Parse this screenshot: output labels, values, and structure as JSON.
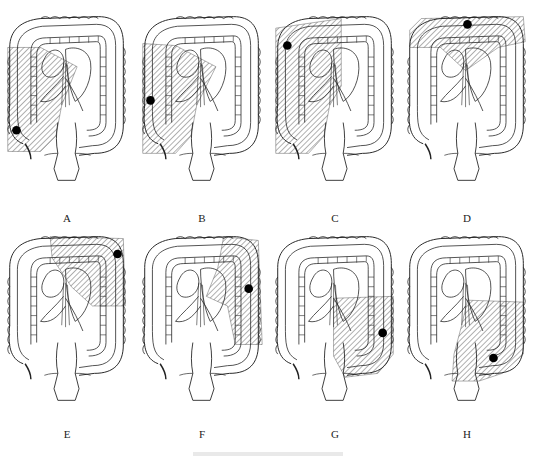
{
  "figure": {
    "panels": [
      {
        "id": "A",
        "label": "A",
        "tumor": [
          15,
          126
        ],
        "region": "right-colon-ileocecal"
      },
      {
        "id": "B",
        "label": "B",
        "tumor": [
          14,
          95
        ],
        "region": "right-colon-ascending"
      },
      {
        "id": "C",
        "label": "C",
        "tumor": [
          18,
          38
        ],
        "region": "right-colon-hepatic-flexure"
      },
      {
        "id": "D",
        "label": "D",
        "tumor": [
          68,
          30
        ],
        "region": "transverse-colon"
      },
      {
        "id": "E",
        "label": "E",
        "tumor": [
          122,
          35
        ],
        "region": "splenic-flexure"
      },
      {
        "id": "F",
        "label": "F",
        "tumor": [
          116,
          70
        ],
        "region": "descending-colon"
      },
      {
        "id": "G",
        "label": "G",
        "tumor": [
          117,
          108
        ],
        "region": "sigmoid-colon"
      },
      {
        "id": "H",
        "label": "H",
        "tumor": [
          95,
          128
        ],
        "region": "rectosigmoid"
      }
    ],
    "caption": ""
  },
  "colors": {
    "line": "#222222",
    "hatch": "#333333",
    "tumor": "#000000",
    "background": "#ffffff"
  }
}
